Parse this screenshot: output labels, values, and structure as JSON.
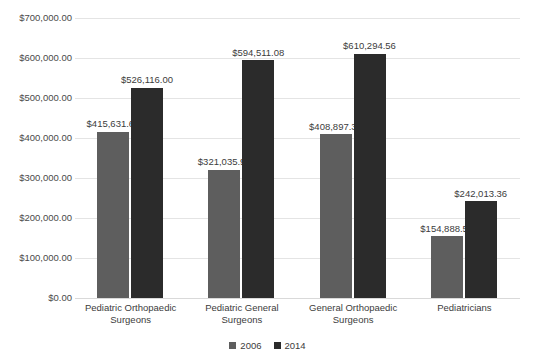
{
  "chart_data": {
    "type": "bar",
    "title": "",
    "xlabel": "",
    "ylabel": "",
    "ylim": [
      0,
      700000
    ],
    "ytick_step": 100000,
    "grid": true,
    "legend_position": "bottom",
    "categories": [
      "Pediatric Orthopaedic Surgeons",
      "Pediatric General Surgeons",
      "General Orthopaedic Surgeons",
      "Pediatricians"
    ],
    "ytick_labels": [
      "$700,000.00",
      "$600,000.00",
      "$500,000.00",
      "$400,000.00",
      "$300,000.00",
      "$200,000.00",
      "$100,000.00",
      "$0.00"
    ],
    "ytick_values": [
      700000,
      600000,
      500000,
      400000,
      300000,
      200000,
      100000,
      0
    ],
    "series": [
      {
        "name": "2006",
        "color": "#5e5e5e",
        "values": [
          415631.64,
          321035.98,
          408897.36,
          154888.55
        ],
        "labels": [
          "$415,631.64",
          "$321,035.98",
          "$408,897.36",
          "$154,888.55"
        ]
      },
      {
        "name": "2014",
        "color": "#2b2b2b",
        "values": [
          526116.0,
          594511.08,
          610294.56,
          242013.36
        ],
        "labels": [
          "$526,116.00",
          "$594,511.08",
          "$610,294.56",
          "$242,013.36"
        ]
      }
    ]
  },
  "category_lines": [
    [
      "Pediatric Orthopaedic",
      "Surgeons"
    ],
    [
      "Pediatric General",
      "Surgeons"
    ],
    [
      "General Orthopaedic",
      "Surgeons"
    ],
    [
      "Pediatricians",
      ""
    ]
  ]
}
